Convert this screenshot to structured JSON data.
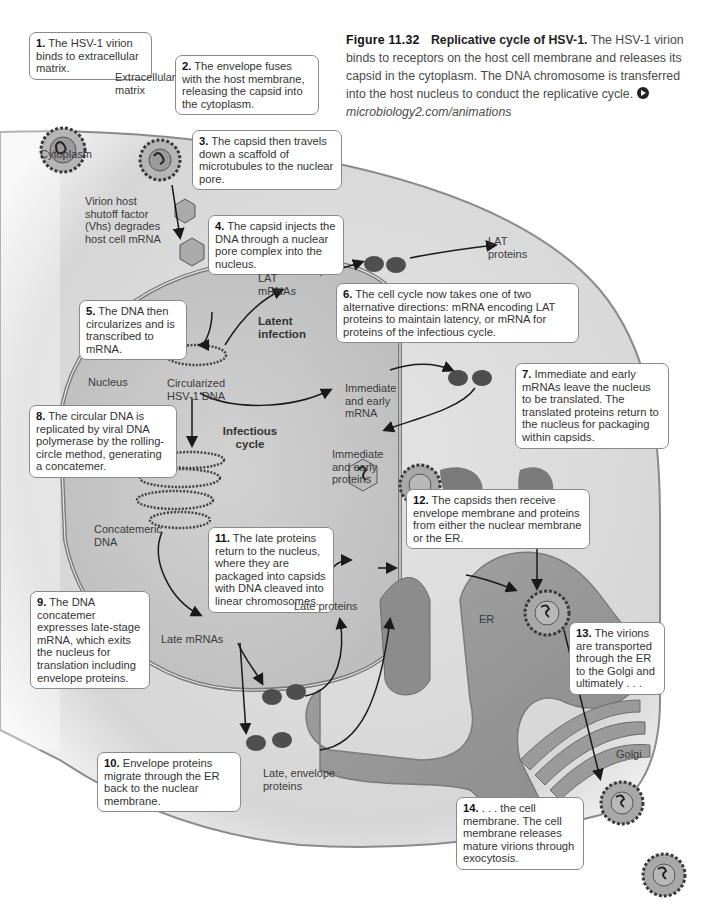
{
  "figure": {
    "number": "Figure 11.32",
    "title": "Replicative cycle of HSV-1.",
    "caption": "The HSV-1 virion binds to receptors on the host cell membrane and releases its capsid in the cytoplasm. The DNA chromosome is transferred into the host nucleus to conduct the replicative cycle.",
    "link_icon": "play-circle-icon",
    "link_text": "microbiology2.com/animations"
  },
  "steps": [
    {
      "num": "1.",
      "text": "The HSV-1 virion binds to extracellular matrix."
    },
    {
      "num": "2.",
      "text": "The envelope fuses with the host membrane, releasing the capsid into the cytoplasm."
    },
    {
      "num": "3.",
      "text": "The capsid then travels down a scaffold of microtubules to the nuclear pore."
    },
    {
      "num": "4.",
      "text": "The capsid injects the DNA through a nuclear pore complex into the nucleus."
    },
    {
      "num": "5.",
      "text": "The DNA then circularizes and is transcribed to mRNA."
    },
    {
      "num": "6.",
      "text": "The cell cycle now takes one of two alternative directions: mRNA encoding LAT proteins to maintain latency, or mRNA for proteins of the infectious cycle."
    },
    {
      "num": "7.",
      "text": "Immediate and early mRNAs leave the nucleus to be translated. The translated proteins return to the nucleus for packaging within capsids."
    },
    {
      "num": "8.",
      "text": "The circular DNA is replicated by viral DNA polymerase by the rolling-circle method, generating a concatemer."
    },
    {
      "num": "9.",
      "text": "The DNA concatemer expresses late-stage mRNA, which exits the nucleus for translation including envelope proteins."
    },
    {
      "num": "10.",
      "text": "Envelope proteins migrate through the ER back to the nuclear membrane."
    },
    {
      "num": "11.",
      "text": "The late proteins return to the nucleus, where they are packaged into capsids with DNA cleaved into linear chromosomes."
    },
    {
      "num": "12.",
      "text": "The capsids then receive envelope membrane and proteins from either the nuclear membrane or the ER."
    },
    {
      "num": "13.",
      "text": "The virions are transported through the ER to the Golgi and ultimately . . ."
    },
    {
      "num": "14.",
      "text": ". . . the cell membrane. The cell membrane releases mature virions through exocytosis."
    }
  ],
  "labels": {
    "extracellular_matrix": "Extracellular matrix",
    "cytoplasm": "Cytoplasm",
    "vhs": "Virion host shutoff factor (Vhs) degrades host cell mRNA",
    "lat_mrnas": "LAT mRNAs",
    "lat_proteins": "LAT proteins",
    "latent_infection": "Latent infection",
    "nucleus": "Nucleus",
    "circularized_dna": "Circularized HSV-1 DNA",
    "immediate_early_mrna": "Immediate and early mRNA",
    "infectious_cycle": "Infectious cycle",
    "immediate_early_proteins": "Immediate and early proteins",
    "concatemeric_dna": "Concatemeric DNA",
    "late_proteins": "Late proteins",
    "late_mrnas": "Late mRNAs",
    "er": "ER",
    "golgi": "Golgi",
    "late_envelope_proteins": "Late, envelope proteins"
  },
  "colors": {
    "cytoplasm": "#dcdcdc",
    "nucleus": "#c9c9c9",
    "er_lumen": "#8f8f8f",
    "membrane": "#7a7a7a",
    "callout_border": "#8a8a8a"
  }
}
